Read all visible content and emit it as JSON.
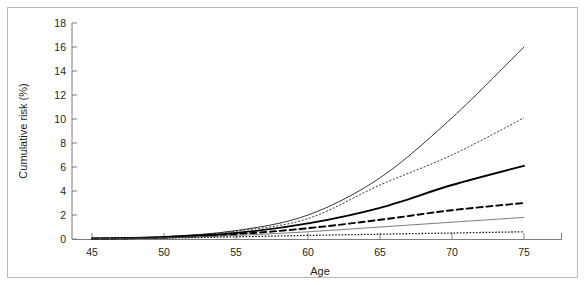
{
  "chart_data": {
    "type": "line",
    "title": "",
    "xlabel": "Age",
    "ylabel": "Cumulative risk (%)",
    "xlim": [
      43,
      77
    ],
    "ylim": [
      0,
      18
    ],
    "xticks": [
      45,
      50,
      55,
      60,
      65,
      70,
      75
    ],
    "yticks": [
      0,
      2,
      4,
      6,
      8,
      10,
      12,
      14,
      16,
      18
    ],
    "grid": false,
    "legend": "none",
    "x": [
      45,
      50,
      55,
      60,
      65,
      70,
      75
    ],
    "series": [
      {
        "name": "curve-1-highest",
        "style": "solid",
        "width": "thin",
        "color": "#231f20",
        "values": [
          0.05,
          0.2,
          0.7,
          2.0,
          5.1,
          10.1,
          16.0
        ]
      },
      {
        "name": "curve-2",
        "style": "dotted-fine",
        "width": "thin",
        "color": "#231f20",
        "values": [
          0.05,
          0.2,
          0.65,
          1.7,
          4.5,
          7.0,
          10.1
        ]
      },
      {
        "name": "curve-3",
        "style": "solid",
        "width": "thick",
        "color": "#000000",
        "values": [
          0.04,
          0.15,
          0.5,
          1.3,
          2.6,
          4.5,
          6.1
        ]
      },
      {
        "name": "curve-4",
        "style": "dashed",
        "width": "thick",
        "color": "#000000",
        "values": [
          0.03,
          0.12,
          0.4,
          0.9,
          1.6,
          2.4,
          3.0
        ]
      },
      {
        "name": "curve-5",
        "style": "solid",
        "width": "thin",
        "color": "#6e6e6e",
        "values": [
          0.02,
          0.09,
          0.3,
          0.6,
          1.0,
          1.4,
          1.8
        ]
      },
      {
        "name": "curve-6-lowest",
        "style": "dotted",
        "width": "medium",
        "color": "#231f20",
        "values": [
          0.02,
          0.07,
          0.18,
          0.3,
          0.4,
          0.5,
          0.6
        ]
      }
    ]
  },
  "axes": {
    "x_label": "Age",
    "y_label": "Cumulative risk (%)",
    "x_tick_labels": [
      "45",
      "50",
      "55",
      "60",
      "65",
      "70",
      "75"
    ],
    "y_tick_labels": [
      "0",
      "2",
      "4",
      "6",
      "8",
      "10",
      "12",
      "14",
      "16",
      "18"
    ]
  },
  "colors": {
    "axis": "#7d7d7d",
    "frame": "#b9b9b9",
    "text": "#231f20",
    "gray_series": "#6e6e6e",
    "background": "#ffffff"
  }
}
